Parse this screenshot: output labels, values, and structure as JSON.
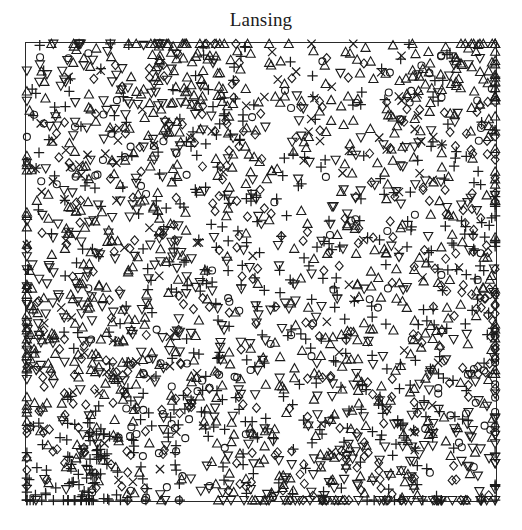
{
  "figure": {
    "title": "Lansing",
    "background_color": "#ffffff",
    "ink_color": "#1b1b1b"
  },
  "plot": {
    "frame": {
      "x": 25,
      "y": 42,
      "width": 472,
      "height": 460
    },
    "frame_color": "#2a2a2a",
    "frame_line_width": 1,
    "marker_line_width": 1.1,
    "marker_size": 9
  },
  "chart_data": {
    "type": "scatter",
    "title": "Lansing",
    "xlabel": "",
    "ylabel": "",
    "xlim": [
      0,
      1
    ],
    "ylim": [
      0,
      1
    ],
    "grid": false,
    "axes_visible": false,
    "tick_labels_visible": false,
    "legend": null,
    "legend_position": "none",
    "window_shape": "rectangle",
    "n_points": 2251,
    "marks_label": "species",
    "series": [
      {
        "name": "blackoak",
        "glyph": "circle",
        "count": 135,
        "seed": 11,
        "clusters": [
          [
            0.12,
            0.8,
            0.16
          ],
          [
            0.46,
            0.33,
            0.18
          ],
          [
            0.84,
            0.86,
            0.15
          ],
          [
            0.72,
            0.52,
            0.17
          ],
          [
            0.3,
            0.13,
            0.14
          ],
          [
            0.93,
            0.22,
            0.12
          ]
        ],
        "uniform_frac": 0.34
      },
      {
        "name": "hickory",
        "glyph": "triangle-up",
        "count": 703,
        "seed": 23,
        "clusters": [
          [
            0.21,
            0.62,
            0.28
          ],
          [
            0.62,
            0.76,
            0.3
          ],
          [
            0.84,
            0.45,
            0.24
          ],
          [
            0.35,
            0.92,
            0.2
          ],
          [
            0.55,
            0.16,
            0.22
          ],
          [
            0.08,
            0.3,
            0.2
          ],
          [
            0.93,
            0.93,
            0.16
          ]
        ],
        "uniform_frac": 0.4
      },
      {
        "name": "maple",
        "glyph": "plus",
        "count": 514,
        "seed": 37,
        "clusters": [
          [
            0.55,
            0.44,
            0.26
          ],
          [
            0.8,
            0.18,
            0.24
          ],
          [
            0.3,
            0.22,
            0.22
          ],
          [
            0.88,
            0.62,
            0.2
          ],
          [
            0.44,
            0.7,
            0.22
          ],
          [
            0.12,
            0.06,
            0.16
          ]
        ],
        "uniform_frac": 0.42
      },
      {
        "name": "misc",
        "glyph": "x",
        "count": 105,
        "seed": 53,
        "clusters": [
          [
            0.62,
            0.84,
            0.2
          ],
          [
            0.24,
            0.3,
            0.22
          ],
          [
            0.8,
            0.3,
            0.2
          ],
          [
            0.1,
            0.7,
            0.18
          ]
        ],
        "uniform_frac": 0.5
      },
      {
        "name": "redoak",
        "glyph": "diamond",
        "count": 346,
        "seed": 71,
        "clusters": [
          [
            0.16,
            0.18,
            0.22
          ],
          [
            0.5,
            0.58,
            0.24
          ],
          [
            0.86,
            0.72,
            0.2
          ],
          [
            0.33,
            0.84,
            0.2
          ],
          [
            0.7,
            0.1,
            0.18
          ],
          [
            0.95,
            0.4,
            0.15
          ]
        ],
        "uniform_frac": 0.42
      },
      {
        "name": "whiteoak",
        "glyph": "triangle-down",
        "count": 448,
        "seed": 97,
        "clusters": [
          [
            0.4,
            0.52,
            0.26
          ],
          [
            0.18,
            0.92,
            0.22
          ],
          [
            0.74,
            0.66,
            0.24
          ],
          [
            0.9,
            0.1,
            0.2
          ],
          [
            0.56,
            0.06,
            0.2
          ],
          [
            0.05,
            0.46,
            0.18
          ]
        ],
        "uniform_frac": 0.44
      }
    ],
    "density_note": "Inhomogeneous multitype point pattern; density highest near the left and lower-left margins and along the upper band."
  }
}
